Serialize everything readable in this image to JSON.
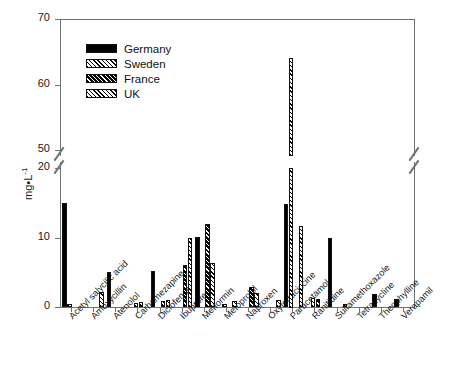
{
  "chart_data": {
    "type": "bar",
    "title": "",
    "xlabel": "",
    "ylabel": "mg•L",
    "ylabel_sup": "-1",
    "grid": false,
    "legend_position": "top-left",
    "axis_break": {
      "lower_max": 20,
      "upper_min": 50
    },
    "ylim": [
      0,
      70
    ],
    "lower_ticks": [
      0,
      10,
      20
    ],
    "upper_ticks": [
      50,
      60,
      70
    ],
    "categories": [
      "Acetyl salycilic acid",
      "Amoxycillin",
      "Atenolol",
      "Carbamezapine",
      "Diclofenac",
      "Ibuprofen",
      "Metformin",
      "Metoprolol",
      "Naproxen",
      "Oxytetraciccine",
      "Paracetamol",
      "Ranitidine",
      "Sulfamethoxazole",
      "Tetracycline",
      "Theophylline",
      "Verapamil"
    ],
    "series": [
      {
        "name": "Germany",
        "color": "#000000",
        "pattern": "solid",
        "values": [
          15.0,
          0,
          5.0,
          0,
          5.2,
          0,
          10.1,
          0,
          0,
          0,
          14.8,
          0,
          10.0,
          0,
          1.8,
          1.1
        ]
      },
      {
        "name": "Sweden",
        "color": "#ffffff",
        "pattern": "hatch-light",
        "values": [
          0.5,
          0,
          0,
          0.6,
          0,
          0,
          0,
          0.4,
          0,
          0,
          64.0,
          1.3,
          0,
          0,
          0,
          0
        ]
      },
      {
        "name": "France",
        "color": "#ffffff",
        "pattern": "hatch-dense",
        "values": [
          0,
          0,
          0,
          0.7,
          0.9,
          6.1,
          12.0,
          0,
          2.9,
          0,
          0,
          1.1,
          0,
          0,
          0,
          0
        ]
      },
      {
        "name": "UK",
        "color": "#ffffff",
        "pattern": "hatch-light",
        "values": [
          0,
          2.2,
          0,
          0,
          1.0,
          10.0,
          6.3,
          0.8,
          2.0,
          1.0,
          11.6,
          0,
          0.4,
          0,
          0,
          0
        ]
      }
    ]
  },
  "legend": {
    "items": [
      {
        "label": "Germany"
      },
      {
        "label": "Sweden"
      },
      {
        "label": "France"
      },
      {
        "label": "UK"
      }
    ]
  }
}
